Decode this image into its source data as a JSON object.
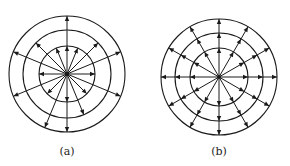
{
  "figure": {
    "stroke_color": "#1a1a1a",
    "panels": [
      {
        "id": "a",
        "caption": "(a)",
        "center": [
          67,
          74
        ],
        "ring_radii": [
          28,
          44,
          58
        ],
        "rays": [
          {
            "angle_deg": 0,
            "length": 28,
            "arrows_at": [
              28
            ]
          },
          {
            "angle_deg": 22.5,
            "length": 58,
            "arrows_at": [
              58
            ]
          },
          {
            "angle_deg": 45,
            "length": 44,
            "arrows_at": [
              44
            ]
          },
          {
            "angle_deg": 67.5,
            "length": 28,
            "arrows_at": [
              28
            ]
          },
          {
            "angle_deg": 90,
            "length": 58,
            "arrows_at": [
              28,
              58
            ]
          },
          {
            "angle_deg": 112.5,
            "length": 28,
            "arrows_at": [
              28
            ]
          },
          {
            "angle_deg": 135,
            "length": 44,
            "arrows_at": [
              44
            ]
          },
          {
            "angle_deg": 157.5,
            "length": 58,
            "arrows_at": [
              58
            ]
          },
          {
            "angle_deg": 180,
            "length": 28,
            "arrows_at": [
              28
            ]
          },
          {
            "angle_deg": 202.5,
            "length": 58,
            "arrows_at": [
              58
            ]
          },
          {
            "angle_deg": 225,
            "length": 28,
            "arrows_at": [
              28
            ]
          },
          {
            "angle_deg": 247.5,
            "length": 58,
            "arrows_at": [
              58
            ]
          },
          {
            "angle_deg": 270,
            "length": 58,
            "arrows_at": [
              28,
              58
            ]
          },
          {
            "angle_deg": 292.5,
            "length": 44,
            "arrows_at": [
              44
            ]
          },
          {
            "angle_deg": 315,
            "length": 28,
            "arrows_at": [
              28
            ]
          },
          {
            "angle_deg": 337.5,
            "length": 58,
            "arrows_at": [
              58
            ]
          }
        ]
      },
      {
        "id": "b",
        "caption": "(b)",
        "center": [
          219,
          77
        ],
        "ring_radii": [
          29,
          44,
          58
        ],
        "ray_count": 12,
        "ray_length": 58,
        "arrows_at": [
          29,
          44,
          58
        ]
      }
    ]
  }
}
